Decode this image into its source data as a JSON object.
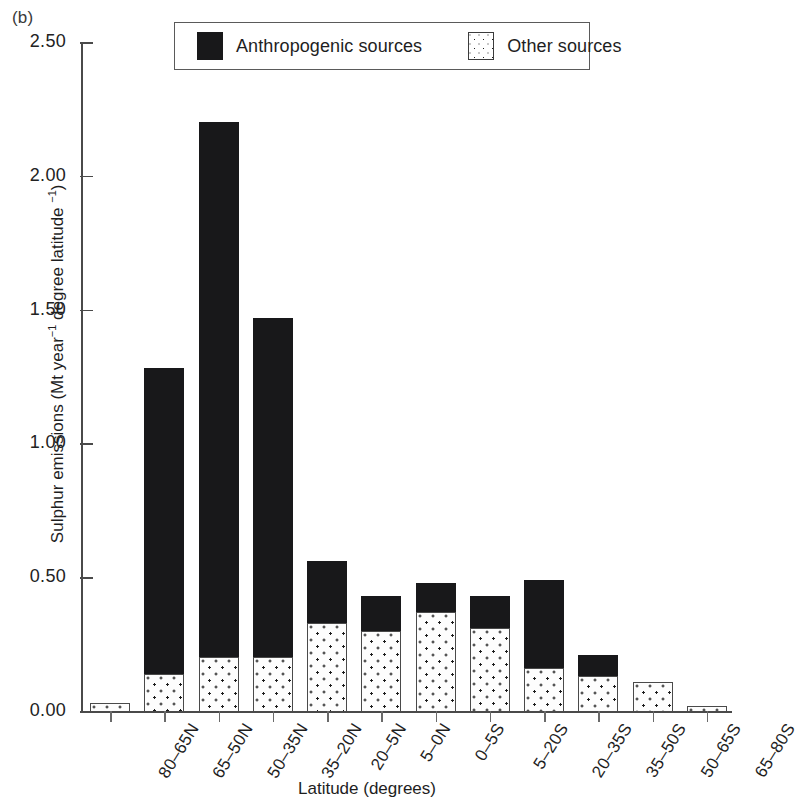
{
  "panel": {
    "label": "(b)"
  },
  "legend": {
    "entries": [
      {
        "label": "Anthropogenic sources",
        "swatch": "black-fill-swatch",
        "color": "#18181a"
      },
      {
        "label": "Other sources",
        "swatch": "dotted-fill-swatch",
        "color": "#ffffff"
      }
    ]
  },
  "axes": {
    "y_title_main": "Sulphur emissions (Mt year",
    "y_title_sup1": "−1",
    "y_title_mid": " degree latitude ",
    "y_title_sup2": "−1",
    "y_title_end": ")",
    "x_title": "Latitude (degrees)",
    "y_ticks": [
      "0.00",
      "0.50",
      "1.00",
      "1.50",
      "2.00",
      "2.50"
    ]
  },
  "chart_data": {
    "type": "bar",
    "stacked": true,
    "title": "",
    "xlabel": "Latitude (degrees)",
    "ylabel": "Sulphur emissions (Mt year−1 degree latitude −1)",
    "ylim": [
      0.0,
      2.5
    ],
    "ytick_values": [
      0.0,
      0.5,
      1.0,
      1.5,
      2.0,
      2.5
    ],
    "grid": false,
    "legend_position": "top-center",
    "categories": [
      "80–65N",
      "65–50N",
      "50–35N",
      "35–20N",
      "20–5N",
      "5–0N",
      "0–5S",
      "5–20S",
      "20–35S",
      "35–50S",
      "50–65S",
      "65–80S"
    ],
    "series": [
      {
        "name": "Other sources",
        "color": "#ffffff",
        "pattern": "dotted",
        "values": [
          0.03,
          0.14,
          0.2,
          0.2,
          0.33,
          0.3,
          0.37,
          0.31,
          0.16,
          0.13,
          0.11,
          0.02
        ]
      },
      {
        "name": "Anthropogenic sources",
        "color": "#18181a",
        "pattern": "solid",
        "values": [
          0.0,
          1.14,
          2.0,
          1.27,
          0.23,
          0.13,
          0.11,
          0.12,
          0.33,
          0.08,
          0.0,
          0.0
        ]
      }
    ],
    "totals": [
      0.03,
      1.28,
      2.2,
      1.47,
      0.56,
      0.43,
      0.48,
      0.43,
      0.49,
      0.21,
      0.11,
      0.02
    ]
  }
}
